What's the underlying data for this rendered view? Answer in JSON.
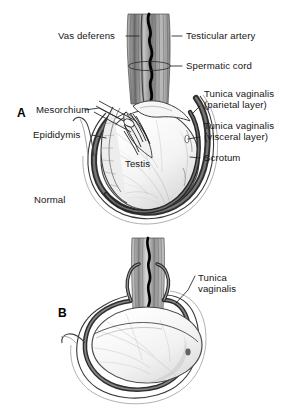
{
  "figure": {
    "background_color": "#ffffff",
    "ink_color": "#1a1a1a",
    "panels": [
      {
        "letter": "A",
        "caption": "Normal",
        "labels": [
          "Vas deferens",
          "Testicular artery",
          "Spermatic cord",
          "Tunica vaginalis (parietal layer)",
          "Tunica vaginalis (visceral layer)",
          "Scrotum",
          "Mesorchium",
          "Epididymis",
          "Testis"
        ]
      },
      {
        "letter": "B",
        "caption": "",
        "labels": [
          "Tunica vaginalis"
        ]
      }
    ]
  },
  "panel_a": {
    "letter": "A",
    "label_vas_deferens": "Vas deferens",
    "label_testicular_artery": "Testicular artery",
    "label_spermatic_cord": "Spermatic cord",
    "label_tunica_parietal_line1": "Tunica vaginalis",
    "label_tunica_parietal_line2": "(parietal layer)",
    "label_tunica_visceral_line1": "Tunica vaginalis",
    "label_tunica_visceral_line2": "(visceral layer)",
    "label_scrotum": "Scrotum",
    "label_mesorchium": "Mesorchium",
    "label_epididymis": "Epididymis",
    "label_testis": "Testis",
    "label_normal": "Normal"
  },
  "panel_b": {
    "letter": "B",
    "label_tunica_line1": "Tunica",
    "label_tunica_line2": "vaginalis"
  },
  "colors": {
    "ink": "#1a1a1a",
    "dark_band": "#3a3a3a",
    "mid_gray": "#8c8c8c",
    "light_gray": "#cfcfcf",
    "fill_pale": "#f2f2f2",
    "background": "#ffffff"
  }
}
